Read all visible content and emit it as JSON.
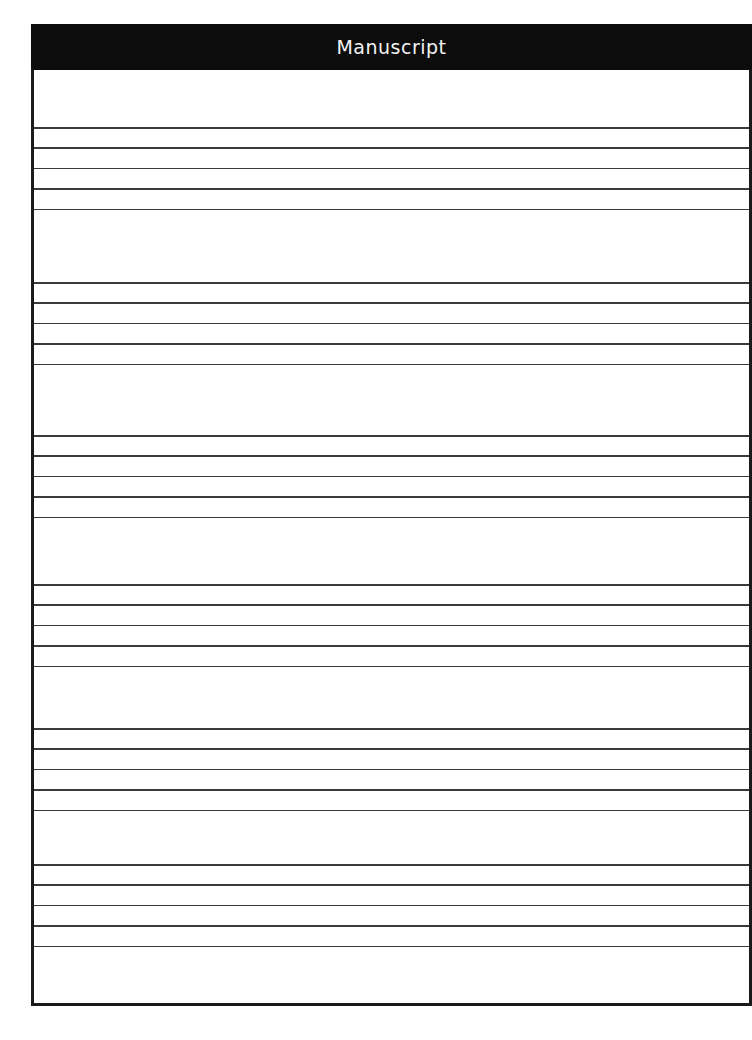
{
  "header": {
    "title": "Manuscript"
  },
  "staves": [
    {
      "top": 127
    },
    {
      "top": 282
    },
    {
      "top": 435
    },
    {
      "top": 584
    },
    {
      "top": 728
    },
    {
      "top": 864
    }
  ],
  "staff_line_spacing": 20.4,
  "lines_per_staff": 5,
  "colors": {
    "header_bg": "#0c0c0c",
    "header_text": "#f2f2f2",
    "line": "#3a3a3a",
    "border": "#1a1a1a"
  }
}
